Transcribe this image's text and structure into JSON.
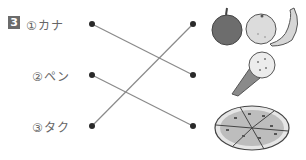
{
  "exercise": {
    "number": "3",
    "items": [
      {
        "label": "①カナ",
        "y": 24
      },
      {
        "label": "②ペン",
        "y": 75
      },
      {
        "label": "③タク",
        "y": 126
      }
    ],
    "pictures": [
      {
        "name": "fruits",
        "description": "apple, orange, banana"
      },
      {
        "name": "ice-cream",
        "description": "ice cream cone"
      },
      {
        "name": "pizza",
        "description": "pizza"
      }
    ],
    "connections": [
      {
        "from": 0,
        "to": 1
      },
      {
        "from": 1,
        "to": 2
      },
      {
        "from": 2,
        "to": 0
      }
    ]
  }
}
